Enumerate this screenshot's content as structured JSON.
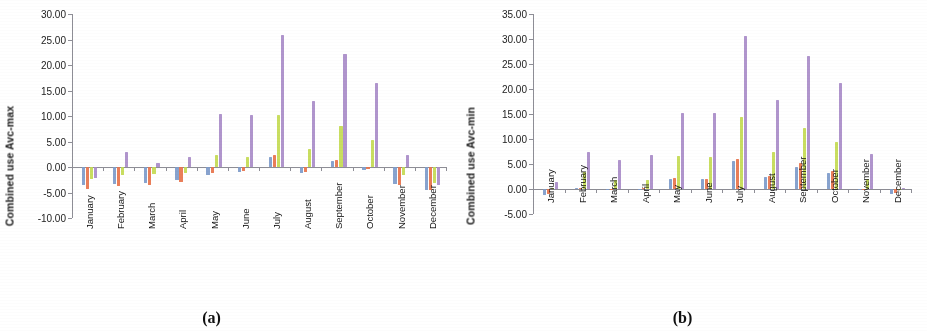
{
  "figure": {
    "panels": [
      {
        "caption": "(a)",
        "ylabel": "Combined use Avc-max",
        "chart_data": {
          "type": "bar",
          "title": "",
          "xlabel": "",
          "ylabel": "Combined use Avc-max",
          "ylim": [
            -10.0,
            30.0
          ],
          "ytick_labels": [
            "30.00",
            "25.00",
            "20.00",
            "15.00",
            "10.00",
            "5.00",
            "0.00",
            "-5.00",
            "-10.00"
          ],
          "ytick_values": [
            30,
            25,
            20,
            15,
            10,
            5,
            0,
            -5,
            -10
          ],
          "grid": false,
          "legend": "none",
          "categories": [
            "January",
            "February",
            "March",
            "April",
            "May",
            "June",
            "July",
            "August",
            "September",
            "October",
            "November",
            "December"
          ],
          "series": [
            {
              "name": "series-1",
              "color": "#7E9BCB",
              "values": [
                -3.6,
                -3.3,
                -3.2,
                -2.6,
                -1.5,
                -1.0,
                2.0,
                -1.2,
                1.2,
                -0.6,
                -3.3,
                -4.5
              ]
            },
            {
              "name": "series-2",
              "color": "#E8734B",
              "values": [
                -4.3,
                -3.7,
                -3.6,
                -3.0,
                -1.2,
                -0.8,
                2.4,
                -0.9,
                1.4,
                -0.4,
                -3.6,
                -4.6
              ]
            },
            {
              "name": "series-3",
              "color": "#C4DB52",
              "values": [
                -2.3,
                -1.5,
                -1.4,
                -1.1,
                2.3,
                1.9,
                10.1,
                3.5,
                8.1,
                5.3,
                -1.5,
                -3.2
              ]
            },
            {
              "name": "series-4",
              "color": "#A98CC9",
              "values": [
                -2.1,
                2.9,
                0.8,
                2.0,
                10.4,
                10.2,
                25.9,
                13.0,
                22.1,
                16.4,
                2.3,
                -3.5
              ]
            }
          ]
        }
      },
      {
        "caption": "(b)",
        "ylabel": "Combined use Avc-min",
        "chart_data": {
          "type": "bar",
          "title": "",
          "xlabel": "",
          "ylabel": "Combined use Avc-min",
          "ylim": [
            -5.0,
            35.0
          ],
          "ytick_labels": [
            "35.00",
            "30.00",
            "25.00",
            "20.00",
            "15.00",
            "10.00",
            "5.00",
            "0.00",
            "-5.00"
          ],
          "ytick_values": [
            35,
            30,
            25,
            20,
            15,
            10,
            5,
            0,
            -5
          ],
          "grid": false,
          "legend": "none",
          "categories": [
            "January",
            "February",
            "March",
            "April",
            "May",
            "June",
            "July",
            "August",
            "September",
            "October",
            "November",
            "December"
          ],
          "series": [
            {
              "name": "series-1",
              "color": "#7E9BCB",
              "values": [
                -1.2,
                0.2,
                0.1,
                0.1,
                2.1,
                2.1,
                5.6,
                2.4,
                4.5,
                3.2,
                0.1,
                -0.9
              ]
            },
            {
              "name": "series-2",
              "color": "#E8734B",
              "values": [
                -1.0,
                0.3,
                0.1,
                0.2,
                2.2,
                2.1,
                6.0,
                2.6,
                5.2,
                3.6,
                0.1,
                -0.8
              ]
            },
            {
              "name": "series-3",
              "color": "#C4DB52",
              "values": [
                0.2,
                3.5,
                1.8,
                1.9,
                6.6,
                6.4,
                14.4,
                7.5,
                12.3,
                9.5,
                2.1,
                0.1
              ]
            },
            {
              "name": "series-4",
              "color": "#A98CC9",
              "values": [
                1.5,
                7.5,
                5.8,
                6.8,
                15.2,
                15.2,
                30.7,
                17.8,
                26.6,
                21.2,
                7.1,
                0.2
              ]
            }
          ]
        }
      }
    ]
  }
}
